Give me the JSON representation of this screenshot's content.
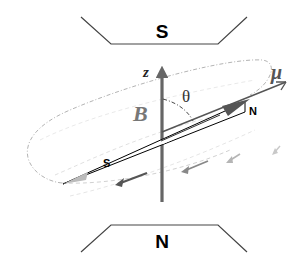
{
  "diagram": {
    "type": "physics-magnetic-dipole-precession",
    "magnets": {
      "top": {
        "label": "S"
      },
      "bottom": {
        "label": "N"
      }
    },
    "axis": {
      "label": "z",
      "field_label": "B"
    },
    "moment": {
      "label": "μ",
      "angle_label": "θ"
    },
    "needle": {
      "north_label": "N",
      "south_label": "S"
    },
    "colors": {
      "axis": "#666666",
      "needle_outline": "#000000",
      "orbit": "#aaaaaa",
      "arrow_dark": "#555555",
      "arrow_mid": "#888888",
      "arrow_light": "#b5b5b5"
    }
  }
}
